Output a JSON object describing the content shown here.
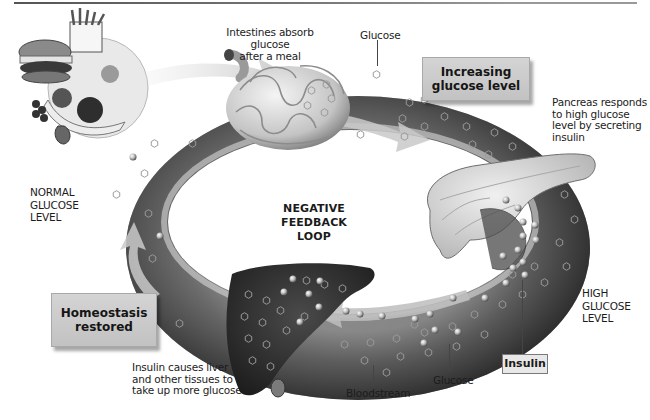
{
  "diagram": {
    "title": "NEGATIVE FEEDBACK LOOP",
    "title_lines": [
      "NEGATIVE FEEDBACK",
      "LOOP"
    ],
    "colors": {
      "bloodstream_dark": "#2b2b2b",
      "bloodstream_light": "#8a8a8a",
      "box_fill": "#c9c9c9",
      "organ_light": "#d9d9d9",
      "liver": "#303030"
    },
    "labels": {
      "intestines": [
        "Intestines absorb glucose",
        "after a meal"
      ],
      "glucose_top": "Glucose",
      "increasing_box": [
        "Increasing",
        "glucose level"
      ],
      "pancreas": [
        "Pancreas responds",
        "to high glucose",
        "level by secreting",
        "insulin"
      ],
      "normal_level": [
        "NORMAL",
        "GLUCOSE",
        "LEVEL"
      ],
      "high_level": [
        "HIGH",
        "GLUCOSE",
        "LEVEL"
      ],
      "homeostasis_box": [
        "Homeostasis",
        "restored"
      ],
      "liver": [
        "Insulin causes liver",
        "and other tissues to",
        "take up more glucose"
      ],
      "bloodstream": "Bloodstream",
      "glucose_bottom": "Glucose",
      "insulin_box": "Insulin"
    },
    "icons": [
      "food-icon",
      "intestines-icon",
      "pancreas-icon",
      "liver-icon",
      "glucose-hexagon-icon",
      "insulin-sphere-icon",
      "flow-arrow-icon"
    ]
  }
}
